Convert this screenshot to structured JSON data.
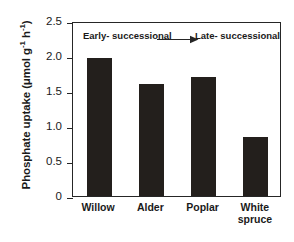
{
  "chart_data": {
    "type": "bar",
    "title": "",
    "xlabel": "",
    "ylabel": "Phosphate uptake (μmol g⁻¹ h⁻¹)",
    "ylabel_parts": {
      "main": "Phosphate uptake (μmol g",
      "sup1": "-1",
      "mid": " h",
      "sup2": "-1",
      "close": ")"
    },
    "categories": [
      "Willow",
      "Alder",
      "Poplar",
      "White spruce"
    ],
    "category_labels_multiline": [
      "Willow",
      "Alder",
      "Poplar",
      "White\nspruce"
    ],
    "values": [
      1.97,
      1.6,
      1.7,
      0.84
    ],
    "ylim": [
      0,
      2.5
    ],
    "ytick_values": [
      2.5,
      2.0,
      1.5,
      1.0,
      0.5,
      0
    ],
    "ytick_labels": [
      "2.5",
      "2.0",
      "1.5",
      "1.0",
      "0.5",
      "0"
    ],
    "grid": false,
    "legend": null,
    "bar_color": "#231f1c",
    "axis_color": "#262626",
    "annotations": [
      {
        "name": "early-successional",
        "text": "Early-\nsuccessional",
        "position": "top-left"
      },
      {
        "name": "late-successional",
        "text": "Late-\nsuccessional",
        "position": "top-right"
      },
      {
        "name": "succession-arrow",
        "text": "",
        "position": "top-center",
        "direction": "right"
      }
    ]
  },
  "axis": {
    "y_title": "Phosphate uptake (μmol g-1 h-1)"
  },
  "annotations": {
    "early": "Early-\nsuccessional",
    "late": "Late-\nsuccessional"
  }
}
